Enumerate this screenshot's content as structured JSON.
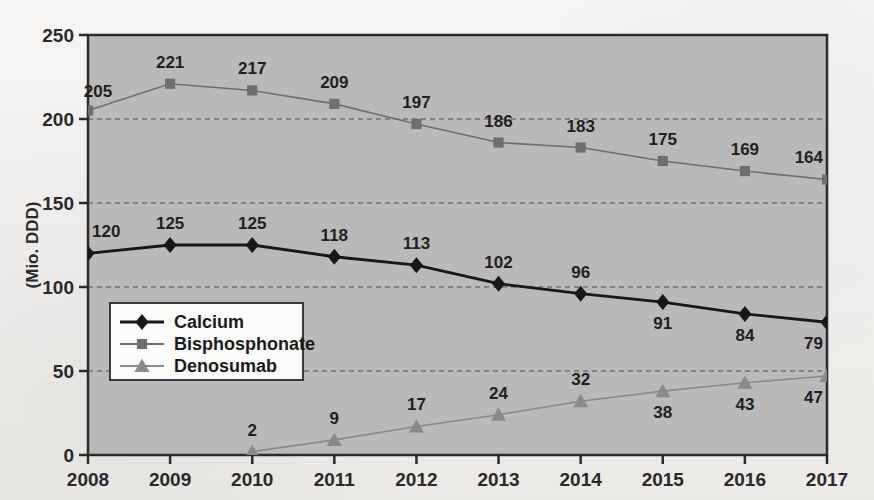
{
  "chart_data": {
    "type": "line",
    "title": "",
    "xlabel": "",
    "ylabel": "(Mio. DDD)",
    "categories": [
      "2008",
      "2009",
      "2010",
      "2011",
      "2012",
      "2013",
      "2014",
      "2015",
      "2016",
      "2017"
    ],
    "ylim": [
      0,
      250
    ],
    "yticks": [
      0,
      50,
      100,
      150,
      200,
      250
    ],
    "ytick_labels": [
      "0",
      "50",
      "100",
      "150",
      "200",
      "250"
    ],
    "grid": true,
    "grid_style": "dashed",
    "legend_position": "center-left",
    "plot_background": "#b9b9b9",
    "series": [
      {
        "name": "Calcium",
        "marker": "diamond",
        "color": "#181818",
        "line_color": "#181818",
        "values": [
          120,
          125,
          125,
          118,
          113,
          102,
          96,
          91,
          84,
          79
        ],
        "label_positions": [
          "above",
          "above",
          "above",
          "above",
          "above",
          "above",
          "above",
          "below",
          "below",
          "below"
        ]
      },
      {
        "name": "Bisphosphonate",
        "marker": "square",
        "color": "#6f6f6f",
        "line_color": "#6f6f6f",
        "values": [
          205,
          221,
          217,
          209,
          197,
          186,
          183,
          175,
          169,
          164
        ],
        "label_positions": [
          "left",
          "above",
          "above",
          "above",
          "above",
          "above",
          "above",
          "above",
          "above",
          "above"
        ]
      },
      {
        "name": "Denosumab",
        "marker": "triangle",
        "color": "#8a8a8a",
        "line_color": "#8a8a8a",
        "values": [
          null,
          null,
          2,
          9,
          17,
          24,
          32,
          38,
          43,
          47
        ],
        "label_positions": [
          null,
          null,
          "above",
          "above",
          "above",
          "above",
          "above",
          "below",
          "below",
          "below"
        ]
      }
    ]
  },
  "legend": {
    "items": [
      {
        "label": "Calcium",
        "marker": "diamond",
        "color": "#181818"
      },
      {
        "label": "Bisphosphonate",
        "marker": "square",
        "color": "#6f6f6f"
      },
      {
        "label": "Denosumab",
        "marker": "triangle",
        "color": "#8a8a8a"
      }
    ]
  },
  "axes": {
    "y_title": "(Mio. DDD)"
  }
}
